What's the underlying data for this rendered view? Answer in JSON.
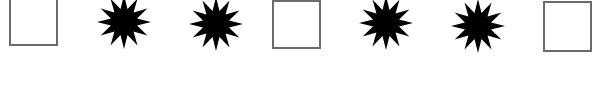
{
  "sequence": {
    "description": "Pattern of squares and 12-point stars",
    "colors": {
      "square_border": "#6b6b6b",
      "square_fill": "#ffffff",
      "star_fill": "#000000",
      "background": "#ffffff"
    },
    "items": [
      {
        "type": "square",
        "x": 9,
        "y": -2,
        "w": 49,
        "h": 48
      },
      {
        "type": "star",
        "cx": 124,
        "cy": 22,
        "r": 27,
        "points": 12
      },
      {
        "type": "star",
        "cx": 216,
        "cy": 24,
        "r": 27,
        "points": 12
      },
      {
        "type": "square",
        "x": 272,
        "y": 0,
        "w": 49,
        "h": 49
      },
      {
        "type": "star",
        "cx": 386,
        "cy": 23,
        "r": 27,
        "points": 12
      },
      {
        "type": "star",
        "cx": 478,
        "cy": 26,
        "r": 27,
        "points": 12
      },
      {
        "type": "square",
        "x": 543,
        "y": 1,
        "w": 49,
        "h": 51
      }
    ]
  }
}
